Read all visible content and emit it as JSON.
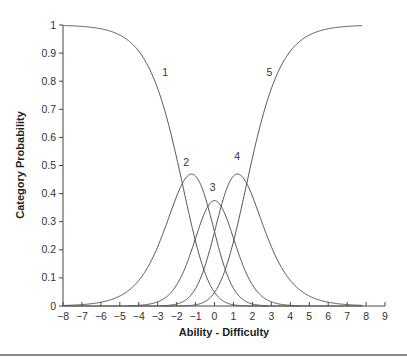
{
  "chart_data": {
    "type": "line",
    "title": "",
    "xlabel": "Ability - Difficulty",
    "ylabel": "Category Probability",
    "xlim": [
      -8,
      9
    ],
    "ylim": [
      0,
      1
    ],
    "x_ticks": [
      -8,
      -7,
      -6,
      -5,
      -4,
      -3,
      -2,
      -1,
      0,
      1,
      2,
      3,
      4,
      5,
      6,
      7,
      8,
      9
    ],
    "x_tick_labels": [
      "−8",
      "−7",
      "−6",
      "−5",
      "−4",
      "−3",
      "−2",
      "−1",
      "0",
      "1",
      "2",
      "3",
      "4",
      "5",
      "6",
      "7",
      "8",
      "9"
    ],
    "y_ticks": [
      0,
      0.1,
      0.2,
      0.3,
      0.4,
      0.5,
      0.6,
      0.7,
      0.8,
      0.9,
      1
    ],
    "y_tick_labels": [
      "0",
      "0.1",
      "0.2",
      "0.3",
      "0.4",
      "0.5",
      "0.6",
      "0.7",
      "0.8",
      "0.9",
      "1"
    ],
    "grid": false,
    "legend": "none (inline curve labels)",
    "model": "rating-scale category probability curves",
    "thresholds": [
      -1.7,
      -0.35,
      0.35,
      1.7
    ],
    "x_range_plotted": [
      -8,
      7.8
    ],
    "series": [
      {
        "name": "1",
        "label_pos": [
          -2.6,
          0.82
        ],
        "peak": {
          "x": -8,
          "y": 1.0
        }
      },
      {
        "name": "2",
        "label_pos": [
          -1.5,
          0.5
        ],
        "peak": {
          "x": -1.3,
          "y": 0.46
        }
      },
      {
        "name": "3",
        "label_pos": [
          -0.1,
          0.41
        ],
        "peak": {
          "x": 0,
          "y": 0.375
        }
      },
      {
        "name": "4",
        "label_pos": [
          1.2,
          0.52
        ],
        "peak": {
          "x": 1.3,
          "y": 0.48
        }
      },
      {
        "name": "5",
        "label_pos": [
          2.9,
          0.82
        ],
        "peak": {
          "x": 7.8,
          "y": 1.0
        }
      }
    ],
    "sample_points": {
      "x": [
        -8,
        -6,
        -4,
        -3,
        -2,
        -1.7,
        -1.3,
        -1,
        0,
        1,
        1.3,
        1.7,
        2,
        3,
        4,
        6,
        7.8
      ],
      "P1": [
        1.0,
        0.99,
        0.92,
        0.78,
        0.52,
        0.44,
        0.32,
        0.24,
        0.05,
        0.01,
        0.0,
        0.0,
        0.0,
        0.0,
        0.0,
        0.0,
        0.0
      ],
      "P2": [
        0.0,
        0.01,
        0.08,
        0.2,
        0.38,
        0.44,
        0.46,
        0.45,
        0.27,
        0.07,
        0.04,
        0.02,
        0.01,
        0.0,
        0.0,
        0.0,
        0.0
      ],
      "P3": [
        0.0,
        0.0,
        0.0,
        0.02,
        0.08,
        0.11,
        0.16,
        0.22,
        0.375,
        0.22,
        0.16,
        0.11,
        0.08,
        0.02,
        0.0,
        0.0,
        0.0
      ],
      "P4": [
        0.0,
        0.0,
        0.0,
        0.0,
        0.01,
        0.02,
        0.04,
        0.07,
        0.27,
        0.45,
        0.46,
        0.44,
        0.38,
        0.2,
        0.08,
        0.01,
        0.0
      ],
      "P5": [
        0.0,
        0.0,
        0.0,
        0.0,
        0.0,
        0.0,
        0.0,
        0.01,
        0.05,
        0.24,
        0.32,
        0.44,
        0.52,
        0.78,
        0.92,
        0.99,
        1.0
      ]
    }
  },
  "colors": {
    "curve": "#555555",
    "axis": "#444444",
    "rule": "#8a8a8a"
  }
}
